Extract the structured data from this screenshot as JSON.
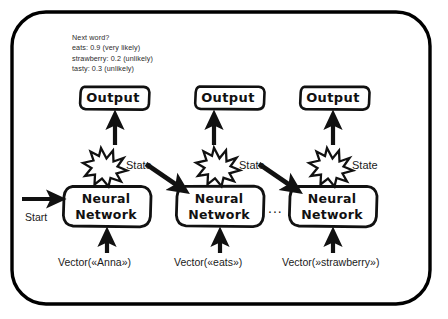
{
  "diagram": {
    "title_annotation": {
      "lines": [
        "Next word?",
        "eats: 0.9 (very likely)",
        "strawberry: 0.2 (unlikely)",
        "tasty: 0.3 (unlikely)"
      ]
    },
    "frame": {
      "border_color": "#000000",
      "background": "#ffffff"
    },
    "ink_color": "#111111",
    "columns": [
      {
        "output_label": "Output",
        "node_label_line1": "Neural",
        "node_label_line2": "Network",
        "state_label": "State",
        "input_label": "Vector(«Anna»)"
      },
      {
        "output_label": "Output",
        "node_label_line1": "Neural",
        "node_label_line2": "Network",
        "state_label": "State",
        "input_label": "Vector(«eats»)"
      },
      {
        "output_label": "Output",
        "node_label_line1": "Neural",
        "node_label_line2": "Network",
        "state_label": "State",
        "input_label": "Vector(»strawberry»)"
      }
    ],
    "start_label": "Start",
    "continuation_ellipsis": "..."
  }
}
